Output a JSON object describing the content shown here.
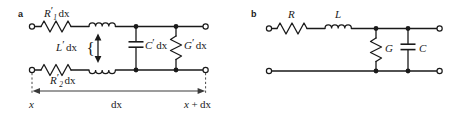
{
  "figure": {
    "type": "circuit-diagram",
    "background_color": "#ffffff",
    "ink_color": "#1a1a1a"
  },
  "panels": [
    {
      "id": "a",
      "label": "a",
      "title": "distributed element model over length dx",
      "components": [
        {
          "name": "series-resistor-top",
          "symbol": "zigzag-resistor",
          "label_main": "R",
          "label_prime": "′",
          "label_sub": "1",
          "label_suffix": "dx",
          "label_full": "R′1 dx"
        },
        {
          "name": "series-inductor-top",
          "symbol": "coil-inductor",
          "label_main": "L",
          "label_prime": "′",
          "label_suffix": "dx",
          "label_full": "L′ dx"
        },
        {
          "name": "series-resistor-bottom",
          "symbol": "zigzag-resistor",
          "label_main": "R",
          "label_prime": "′",
          "label_sub": "2",
          "label_suffix": "dx",
          "label_full": "R′2 dx"
        },
        {
          "name": "series-inductor-bottom",
          "symbol": "coil-inductor",
          "label_main": "",
          "label_full": ""
        },
        {
          "name": "shunt-capacitor",
          "symbol": "parallel-plate-capacitor",
          "label_main": "C",
          "label_prime": "′",
          "label_suffix": "dx",
          "label_full": "C′ dx"
        },
        {
          "name": "shunt-conductance",
          "symbol": "zigzag-resistor",
          "label_main": "G",
          "label_prime": "′",
          "label_suffix": "dx",
          "label_full": "G′ dx"
        }
      ],
      "dimension": {
        "name": "length-dimension",
        "label": "dx",
        "left_label": "x",
        "right_label_x": "x",
        "right_label_op": "+",
        "right_label_dx": "dx",
        "right_label_full": "x + dx",
        "arrow_style": "double-headed"
      },
      "brace_symbol": "{"
    },
    {
      "id": "b",
      "label": "b",
      "title": "lumped element model",
      "components": [
        {
          "name": "series-resistor",
          "symbol": "zigzag-resistor",
          "label_main": "R",
          "label_full": "R"
        },
        {
          "name": "series-inductor",
          "symbol": "coil-inductor",
          "label_main": "L",
          "label_full": "L"
        },
        {
          "name": "shunt-conductance",
          "symbol": "zigzag-resistor",
          "label_main": "G",
          "label_full": "G"
        },
        {
          "name": "shunt-capacitor",
          "symbol": "parallel-plate-capacitor",
          "label_main": "C",
          "label_full": "C"
        }
      ]
    }
  ]
}
